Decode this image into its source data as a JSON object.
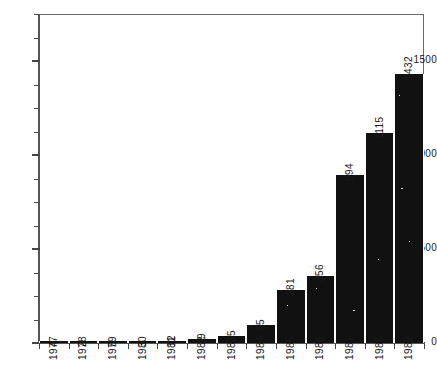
{
  "chart_data": {
    "type": "bar",
    "title": "",
    "subtitle": "",
    "xlabel": "",
    "ylabel": "",
    "categories": [
      "1977",
      "1978",
      "1979",
      "1980",
      "1981",
      "1982",
      "1983",
      "1984",
      "1985",
      "1986",
      "1987",
      "1988",
      "1989"
    ],
    "values": [
      4,
      2,
      5,
      3,
      12,
      19,
      35,
      95,
      281,
      356,
      894,
      1115,
      1432
    ],
    "data_labels": [
      "4",
      "2",
      "5",
      "3",
      "12",
      "19",
      "35",
      "95",
      "281",
      "356",
      "894",
      "1115",
      "1432"
    ],
    "ylim": [
      0,
      1750
    ],
    "ytick_labels": [
      "0",
      "500",
      "1000",
      "1500"
    ],
    "ytick_values": [
      0,
      500,
      1000,
      1500
    ],
    "yminor_interval": 125,
    "grid": false,
    "legend": null,
    "legend_position": "none",
    "bar_color": "#111111",
    "axis_color": "#555555",
    "text_color": "#1a1a1a",
    "background_color": "#ffffff",
    "label_orientation": "vertical-rotated-90",
    "xtick_label_orientation": "vertical-rotated-90"
  }
}
